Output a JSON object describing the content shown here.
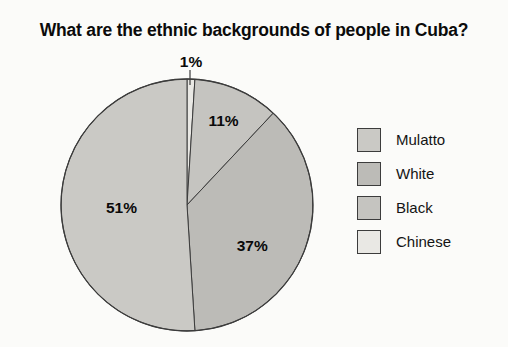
{
  "chart_data": {
    "type": "pie",
    "title": "What are the ethnic backgrounds of people in Cuba?",
    "unit": "%",
    "legend_position": "right",
    "categories": [
      "Mulatto",
      "White",
      "Black",
      "Chinese"
    ],
    "values": [
      51,
      37,
      11,
      1
    ],
    "slices": [
      {
        "name": "Mulatto",
        "value": 51,
        "label": "51%",
        "color": "#cac9c5",
        "label_angle": 268.2,
        "label_r": 0.52
      },
      {
        "name": "White",
        "value": 37,
        "label": "37%",
        "color": "#bcbbb7",
        "label_angle": 122,
        "label_r": 0.61
      },
      {
        "name": "Black",
        "value": 11,
        "label": "11%",
        "color": "#c5c4c0",
        "label_angle": 23.4,
        "label_r": 0.73
      },
      {
        "name": "Chinese",
        "value": 1,
        "label": "1%",
        "color": "#e9e8e4",
        "label_outside": true
      }
    ],
    "stroke": "#3c3c3c",
    "layout": {
      "cx": 187,
      "cy": 205,
      "r": 126,
      "start_deg": 0,
      "clockwise": true,
      "outside_label": {
        "x": 191,
        "y": 61,
        "leader_x": 190,
        "leader_y1": 70,
        "leader_y2": 85
      }
    }
  }
}
